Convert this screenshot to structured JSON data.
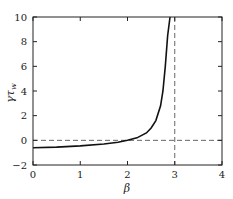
{
  "chart_data": {
    "type": "line",
    "title": "",
    "xlabel": "β",
    "ylabel": "γτ_w",
    "xlim": [
      0,
      4
    ],
    "ylim": [
      -2,
      10
    ],
    "xticks": [
      "0",
      "1",
      "2",
      "3",
      "4"
    ],
    "yticks": [
      "−2",
      "0",
      "2",
      "4",
      "6",
      "8",
      "10"
    ],
    "grid": false,
    "legend": null,
    "series": [
      {
        "name": "γτ_w(β)",
        "style": "solid",
        "x": [
          0,
          0.5,
          1.0,
          1.5,
          1.8,
          2.0,
          2.2,
          2.4,
          2.5,
          2.6,
          2.7,
          2.75,
          2.8,
          2.85,
          2.9
        ],
        "y": [
          -0.6,
          -0.55,
          -0.45,
          -0.3,
          -0.15,
          0.0,
          0.2,
          0.6,
          1.0,
          1.6,
          2.8,
          4.0,
          6.0,
          8.5,
          10
        ]
      }
    ],
    "reference_lines": [
      {
        "type": "horizontal",
        "y": 0,
        "style": "dashed"
      },
      {
        "type": "vertical",
        "x": 3,
        "style": "dashed"
      }
    ]
  }
}
